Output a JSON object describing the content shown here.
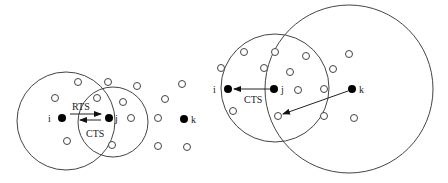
{
  "figure": {
    "left_panel": {
      "nodes": [
        {
          "id": "i",
          "label": "i",
          "x": 62,
          "y": 118,
          "filled": true
        },
        {
          "id": "j",
          "label": "j",
          "x": 109,
          "y": 118,
          "filled": true
        },
        {
          "id": "k",
          "label": "k",
          "x": 184,
          "y": 119,
          "filled": true
        }
      ],
      "open_nodes": [
        [
          78,
          82
        ],
        [
          108,
          82
        ],
        [
          137,
          86
        ],
        [
          55,
          98
        ],
        [
          97,
          98
        ],
        [
          123,
          102
        ],
        [
          165,
          99
        ],
        [
          182,
          84
        ],
        [
          131,
          118
        ],
        [
          158,
          118
        ],
        [
          67,
          141
        ],
        [
          112,
          145
        ],
        [
          158,
          146
        ],
        [
          187,
          147
        ]
      ],
      "ranges": [
        {
          "name": "range-i",
          "cx": 66,
          "cy": 121,
          "r": 49
        },
        {
          "name": "range-j",
          "cx": 113,
          "cy": 122,
          "r": 35
        }
      ],
      "messages": [
        {
          "label": "RTS",
          "from": "i",
          "to": "j"
        },
        {
          "label": "CTS",
          "from": "j",
          "to": "i"
        }
      ]
    },
    "right_panel": {
      "nodes": [
        {
          "id": "i",
          "label": "i",
          "x": 228,
          "y": 89,
          "filled": true
        },
        {
          "id": "j",
          "label": "j",
          "x": 274,
          "y": 89,
          "filled": true
        },
        {
          "id": "k",
          "label": "k",
          "x": 352,
          "y": 89,
          "filled": true
        }
      ],
      "open_nodes": [
        [
          244,
          52
        ],
        [
          275,
          52
        ],
        [
          221,
          68
        ],
        [
          264,
          68
        ],
        [
          306,
          56
        ],
        [
          290,
          72
        ],
        [
          298,
          90
        ],
        [
          333,
          69
        ],
        [
          349,
          54
        ],
        [
          324,
          89
        ],
        [
          233,
          111
        ],
        [
          278,
          116
        ],
        [
          324,
          116
        ],
        [
          354,
          118
        ]
      ],
      "ranges": [
        {
          "name": "range-j",
          "cx": 275,
          "cy": 88,
          "r": 54
        },
        {
          "name": "range-k",
          "cx": 349,
          "cy": 89,
          "r": 84
        }
      ],
      "messages": [
        {
          "label": "CTS",
          "from": "j",
          "to": "i"
        },
        {
          "label": "",
          "from": "k",
          "to": "open-node"
        }
      ]
    }
  },
  "labels": {
    "left_rts": "RTS",
    "left_cts": "CTS",
    "right_cts": "CTS",
    "left_i": "i",
    "left_j": "j",
    "left_k": "k",
    "right_i": "i",
    "right_j": "j",
    "right_k": "k"
  }
}
